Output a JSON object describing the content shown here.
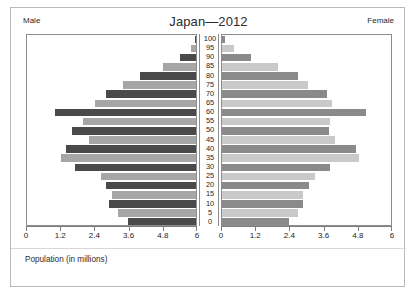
{
  "figure": {
    "title": "Japan—2012",
    "left_side_label": "Male",
    "right_side_label": "Female",
    "axis_caption": "Population (in millions)"
  },
  "axis": {
    "tick_labels_left": [
      "6",
      "4.8",
      "3.6",
      "2.4",
      "1.2",
      "0"
    ],
    "tick_labels_right": [
      "0",
      "1.2",
      "2.4",
      "3.6",
      "4.8",
      "6"
    ],
    "max": 6,
    "tick_step": 1.2
  },
  "colors": {
    "male_dark": "#4a4a4a",
    "male_light": "#a6a6a6",
    "female_dark": "#8a8a8a",
    "female_light": "#c9c9c9",
    "panel_border": "#8d8d8d",
    "figure_border": "#b9b9b9",
    "text": "#1d1d1d"
  },
  "chart_data": {
    "type": "bar",
    "subtype": "population-pyramid",
    "title": "Japan—2012",
    "xlabel": "Population (in millions)",
    "ylabel": "Age",
    "xlim": [
      0,
      6
    ],
    "xticks": [
      0,
      1.2,
      2.4,
      3.6,
      4.8,
      6
    ],
    "grid": false,
    "legend": "none",
    "orientation": "horizontal",
    "categories": [
      "100",
      "95",
      "90",
      "85",
      "80",
      "75",
      "70",
      "65",
      "60",
      "55",
      "50",
      "45",
      "40",
      "35",
      "30",
      "25",
      "20",
      "15",
      "10",
      "5",
      "0"
    ],
    "series": [
      {
        "name": "Male",
        "side": "left",
        "values": [
          0.02,
          0.18,
          0.55,
          1.17,
          1.95,
          2.55,
          3.15,
          3.55,
          4.95,
          3.95,
          4.35,
          3.75,
          4.55,
          4.75,
          4.25,
          3.35,
          3.15,
          2.95,
          3.05,
          2.75,
          2.4
        ]
      },
      {
        "name": "Female",
        "side": "right",
        "values": [
          0.1,
          0.42,
          1.02,
          1.95,
          2.65,
          3.0,
          3.7,
          3.85,
          5.05,
          3.8,
          3.75,
          3.95,
          4.7,
          4.8,
          3.8,
          3.25,
          3.05,
          2.85,
          2.85,
          2.65,
          2.35
        ]
      }
    ]
  }
}
